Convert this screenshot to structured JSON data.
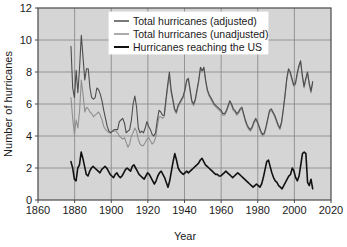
{
  "chart_data": {
    "type": "line",
    "title": "",
    "xlabel": "Year",
    "ylabel": "Number of hurricanes",
    "xlim": [
      1860,
      2020
    ],
    "ylim": [
      0,
      12
    ],
    "xticks": [
      "1860",
      "1880",
      "1900",
      "1920",
      "1940",
      "1960",
      "1980",
      "2000",
      "2020"
    ],
    "yticks": [
      "0",
      "2",
      "4",
      "6",
      "8",
      "10",
      "12"
    ],
    "grid": true,
    "legend_position": "top-center",
    "plot_background": "#d5d5d5",
    "figure_background": "#ffffff",
    "axis_color": "#4a4a4a",
    "grid_color": "#8c8c8c",
    "x_start": 1878,
    "x_end": 2010,
    "series": [
      {
        "name": "Total hurricanes (adjusted)",
        "color": "#4d4d4d",
        "width": 1.1,
        "values": [
          9.6,
          7.0,
          6.4,
          8.1,
          6.7,
          8.3,
          10.3,
          8.9,
          7.5,
          8.2,
          8.2,
          7.0,
          6.4,
          6.3,
          6.4,
          7.0,
          6.9,
          6.6,
          6.2,
          5.6,
          5.1,
          4.6,
          4.3,
          4.2,
          4.3,
          4.4,
          4.4,
          4.4,
          4.9,
          5.0,
          5.1,
          4.8,
          4.2,
          4.3,
          4.4,
          5.0,
          6.0,
          6.5,
          5.8,
          4.5,
          4.2,
          4.3,
          4.2,
          4.5,
          4.9,
          4.6,
          4.4,
          4.1,
          4.0,
          4.2,
          5.0,
          5.6,
          5.5,
          5.3,
          5.3,
          6.3,
          7.2,
          8.0,
          6.9,
          6.3,
          5.7,
          5.5,
          5.9,
          6.1,
          6.3,
          6.5,
          6.9,
          7.5,
          7.6,
          6.9,
          6.2,
          6.0,
          6.3,
          6.9,
          7.5,
          8.3,
          8.1,
          8.3,
          7.5,
          6.9,
          6.6,
          6.4,
          6.2,
          6.0,
          5.9,
          5.8,
          5.7,
          5.6,
          5.4,
          5.4,
          5.6,
          5.9,
          6.2,
          6.0,
          5.7,
          5.6,
          5.4,
          5.5,
          5.7,
          5.8,
          5.4,
          5.0,
          4.7,
          4.5,
          4.4,
          4.6,
          4.9,
          5.1,
          4.9,
          4.6,
          4.3,
          4.1,
          4.2,
          4.6,
          5.1,
          5.6,
          5.7,
          5.5,
          5.3,
          5.0,
          4.7,
          4.5,
          4.9,
          5.7,
          6.6,
          7.6,
          8.2,
          8.0,
          7.6,
          7.2,
          7.3,
          7.9,
          8.4,
          8.7,
          7.8,
          7.1,
          7.6,
          8.0,
          7.3,
          6.8,
          7.4
        ]
      },
      {
        "name": "Total hurricanes (unadjusted)",
        "color": "#8f8f8f",
        "width": 1.1,
        "values": [
          6.4,
          5.1,
          4.1,
          5.0,
          4.5,
          5.6,
          7.5,
          6.6,
          5.5,
          5.8,
          5.7,
          5.5,
          5.4,
          5.2,
          5.3,
          5.4,
          5.5,
          5.3,
          5.0,
          4.6,
          4.4,
          4.3,
          4.2,
          4.2,
          4.3,
          4.3,
          4.3,
          4.2,
          4.0,
          3.9,
          3.8,
          3.9,
          3.6,
          3.3,
          3.5,
          4.0,
          4.2,
          4.5,
          4.3,
          3.8,
          3.5,
          3.4,
          3.4,
          3.6,
          3.8,
          3.9,
          3.7,
          3.5,
          3.6,
          3.9,
          4.6,
          5.2,
          5.2,
          5.1,
          5.2,
          6.1,
          7.0,
          7.7,
          6.7,
          6.2,
          5.6,
          5.4,
          5.8,
          6.0,
          6.2,
          6.4,
          6.8,
          7.4,
          7.5,
          6.8,
          6.1,
          5.9,
          6.2,
          6.8,
          7.4,
          8.2,
          8.0,
          8.2,
          7.4,
          6.8,
          6.5,
          6.3,
          6.1,
          5.9,
          5.8,
          5.7,
          5.6,
          5.5,
          5.3,
          5.3,
          5.5,
          5.8,
          6.1,
          5.9,
          5.6,
          5.5,
          5.3,
          5.4,
          5.6,
          5.7,
          5.3,
          4.9,
          4.6,
          4.4,
          4.3,
          4.5,
          4.8,
          5.0,
          4.8,
          4.5,
          4.2,
          4.0,
          4.1,
          4.5,
          5.0,
          5.5,
          5.6,
          5.4,
          5.2,
          4.9,
          4.6,
          4.4,
          4.8,
          5.6,
          6.5,
          7.5,
          8.1,
          7.9,
          7.5,
          7.1,
          7.2,
          7.8,
          8.3,
          8.6,
          7.7,
          7.0,
          7.5,
          7.9,
          7.2,
          6.7,
          7.3
        ]
      },
      {
        "name": "Hurricanes reaching the US",
        "color": "#111111",
        "width": 1.6,
        "values": [
          2.4,
          2.0,
          1.3,
          1.2,
          2.0,
          2.2,
          3.0,
          2.6,
          2.1,
          1.6,
          1.5,
          1.8,
          2.0,
          2.1,
          2.0,
          1.9,
          1.8,
          1.7,
          1.9,
          2.0,
          2.1,
          2.0,
          1.8,
          1.6,
          1.5,
          1.4,
          1.6,
          1.7,
          1.5,
          1.4,
          1.5,
          1.7,
          1.9,
          2.0,
          1.9,
          1.8,
          2.1,
          2.2,
          2.0,
          1.8,
          1.6,
          1.5,
          1.4,
          1.3,
          1.5,
          1.7,
          1.6,
          1.4,
          1.2,
          1.0,
          1.2,
          1.5,
          1.7,
          1.8,
          1.6,
          1.4,
          1.1,
          0.8,
          1.2,
          1.8,
          2.4,
          2.9,
          2.5,
          2.0,
          1.8,
          1.7,
          1.6,
          1.7,
          1.8,
          1.7,
          1.8,
          1.9,
          2.0,
          2.1,
          2.2,
          2.3,
          2.5,
          2.6,
          2.4,
          2.2,
          2.1,
          2.0,
          1.9,
          1.8,
          1.7,
          1.6,
          1.6,
          1.5,
          1.5,
          1.6,
          1.7,
          1.8,
          1.7,
          1.6,
          1.5,
          1.4,
          1.5,
          1.6,
          1.7,
          1.6,
          1.5,
          1.4,
          1.3,
          1.2,
          1.1,
          1.0,
          0.9,
          0.8,
          0.9,
          1.0,
          0.9,
          0.8,
          1.0,
          1.4,
          1.9,
          2.4,
          2.5,
          2.1,
          1.7,
          1.4,
          1.2,
          1.1,
          0.9,
          0.8,
          0.7,
          0.9,
          1.1,
          1.3,
          1.5,
          1.6,
          2.0,
          1.8,
          1.4,
          1.2,
          1.5,
          2.2,
          2.9,
          3.0,
          2.9,
          1.1,
          0.9,
          1.3,
          0.7
        ]
      }
    ]
  }
}
